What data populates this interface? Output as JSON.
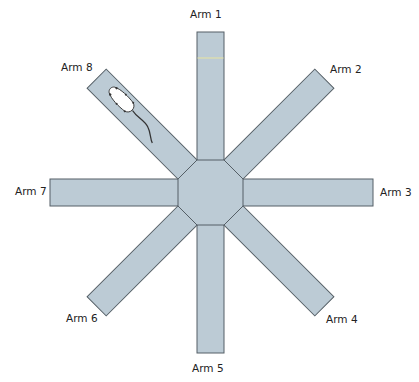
{
  "diagram": {
    "center": [
      210.5,
      192.5
    ],
    "arm_width": 27,
    "arm_length": 161,
    "hub_radius": 32.5,
    "colors": {
      "fill": "#bccbd5",
      "stroke": "#555f66",
      "marker_line": "#e8e4a0"
    },
    "arms": [
      {
        "label": "Arm 1",
        "angle": -90
      },
      {
        "label": "Arm 2",
        "angle": -45
      },
      {
        "label": "Arm 3",
        "angle": 0
      },
      {
        "label": "Arm 4",
        "angle": 45
      },
      {
        "label": "Arm 5",
        "angle": 90
      },
      {
        "label": "Arm 6",
        "angle": 135
      },
      {
        "label": "Arm 7",
        "angle": 180
      },
      {
        "label": "Arm 8",
        "angle": -135
      }
    ],
    "animal": {
      "type": "rat",
      "location": "Arm 8"
    }
  }
}
